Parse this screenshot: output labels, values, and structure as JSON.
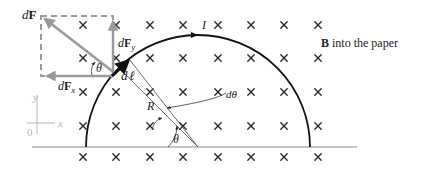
{
  "figure": {
    "colors": {
      "background": "#ffffff",
      "ink": "#222222",
      "force_gray": "#9a9a9a",
      "axis_gray": "#b5b5b5",
      "baseline": "#8a8a8a"
    }
  },
  "labels": {
    "dF": "dF",
    "dF_d": "d",
    "dF_F": "F",
    "dFy_d": "d",
    "dFy_F": "F",
    "dFy_sub": "y",
    "dFx_d": "d",
    "dFx_F": "F",
    "dFx_sub": "x",
    "dl_d": "d",
    "dl_l": "ℓ",
    "current": "I",
    "radius": "R",
    "dtheta": "dθ",
    "theta_center": "θ",
    "theta_force": "θ",
    "field_B": "B",
    "field_text": " into the paper",
    "axis_x": "x",
    "axis_y": "y",
    "axis_origin": "0"
  },
  "geometry": {
    "center": [
      198,
      147
    ],
    "radius": 112,
    "current_element_angle_deg": 135,
    "dtheta_deg": 6
  },
  "field_marks": {
    "symbol": "×",
    "columns_x": [
      83,
      116,
      150,
      183,
      218,
      251,
      284,
      318
    ],
    "rows_y": [
      25,
      58,
      92,
      126,
      157
    ]
  }
}
